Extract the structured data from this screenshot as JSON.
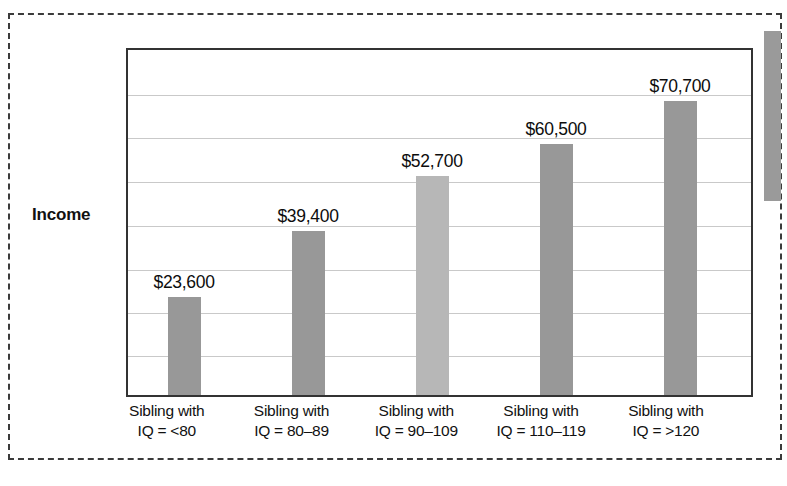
{
  "figure": {
    "y_axis_title": "Income",
    "frame_style": "dashed",
    "frame_color": "#3b3b3b"
  },
  "chart_data": {
    "type": "bar",
    "title": "",
    "xlabel": "",
    "ylabel": "Income",
    "categories": [
      "Sibling with IQ = <80",
      "Sibling with IQ = 80–89",
      "Sibling with IQ = 90–109",
      "Sibling with IQ = 110–119",
      "Sibling with IQ = >120"
    ],
    "category_lines": [
      [
        "Sibling with",
        "IQ = <80"
      ],
      [
        "Sibling with",
        "IQ = 80–89"
      ],
      [
        "Sibling with",
        "IQ = 90–109"
      ],
      [
        "Sibling with",
        "IQ = 110–119"
      ],
      [
        "Sibling with",
        "IQ = >120"
      ]
    ],
    "values": [
      23600,
      52700,
      39400,
      60500,
      70700
    ],
    "values_ordered": [
      23600,
      39400,
      52700,
      60500,
      70700
    ],
    "value_labels": [
      "$23,600",
      "$39,400",
      "$52,700",
      "$60,500",
      "$70,700"
    ],
    "bar_colors": [
      "#989898",
      "#989898",
      "#b7b7b7",
      "#989898",
      "#989898"
    ],
    "ylim": [
      0,
      80000
    ],
    "gridlines": true,
    "gridline_count": 7,
    "gridline_values": [
      10000,
      20000,
      30000,
      40000,
      50000,
      60000,
      70000
    ],
    "legend": "none",
    "axis_tick_labels": []
  },
  "bars": [
    {
      "label": "$23,600",
      "value": 23600,
      "color": "#989898",
      "left_pct": 6.4,
      "width_pct": 5.3,
      "height_pct": 28.5,
      "label_left_pct": -1.0,
      "label_width_pct": 20.0
    },
    {
      "label": "$39,400",
      "value": 39400,
      "color": "#989898",
      "left_pct": 26.3,
      "width_pct": 5.3,
      "height_pct": 47.5,
      "label_left_pct": 18.9,
      "label_width_pct": 20.0
    },
    {
      "label": "$52,700",
      "value": 52700,
      "color": "#b7b7b7",
      "left_pct": 46.2,
      "width_pct": 5.3,
      "height_pct": 63.4,
      "label_left_pct": 38.8,
      "label_width_pct": 20.0
    },
    {
      "label": "$60,500",
      "value": 60500,
      "color": "#989898",
      "left_pct": 66.1,
      "width_pct": 5.3,
      "height_pct": 72.8,
      "label_left_pct": 58.7,
      "label_width_pct": 20.0
    },
    {
      "label": "$70,700",
      "value": 70700,
      "color": "#989898",
      "left_pct": 86.0,
      "width_pct": 5.3,
      "height_pct": 85.1,
      "label_left_pct": 78.6,
      "label_width_pct": 20.0
    }
  ],
  "gridline_positions_pct": [
    12.9,
    25.4,
    38.4,
    51.0,
    63.9,
    76.2,
    88.8
  ],
  "category_label_positions_pct": [
    -3.5,
    16.4,
    36.3,
    56.2,
    76.1
  ]
}
